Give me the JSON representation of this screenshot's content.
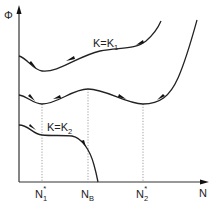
{
  "axes": {
    "y_label": "Φ",
    "x_label": "N"
  },
  "curves": [
    {
      "name": "K=K1",
      "label_main": "K=K",
      "label_sub": "1"
    },
    {
      "name": "intermediate K",
      "label_main": "",
      "label_sub": ""
    },
    {
      "name": "K=K2",
      "label_main": "K=K",
      "label_sub": "2"
    }
  ],
  "x_ticks": [
    {
      "main": "N",
      "sub": "1",
      "sup": "*"
    },
    {
      "main": "N",
      "sub": "B",
      "sup": ""
    },
    {
      "main": "N",
      "sub": "2",
      "sup": "*"
    }
  ],
  "colors": {
    "line": "#222222",
    "guide": "#888888",
    "background": "#ffffff"
  }
}
